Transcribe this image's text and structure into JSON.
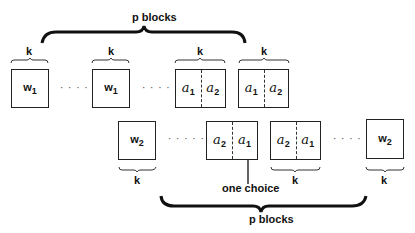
{
  "top": {
    "brace_label": "p  blocks",
    "k_labels": [
      "k",
      "k",
      "k",
      "k"
    ],
    "boxes": [
      {
        "type": "single",
        "var": "w",
        "sub": "1"
      },
      {
        "type": "single",
        "var": "w",
        "sub": "1"
      },
      {
        "type": "split",
        "left": {
          "var": "a",
          "sub": "1"
        },
        "right": {
          "var": "a",
          "sub": "2"
        }
      },
      {
        "type": "split",
        "left": {
          "var": "a",
          "sub": "1"
        },
        "right": {
          "var": "a",
          "sub": "2"
        }
      }
    ],
    "dots": [
      "· · · ·",
      "· · · ·"
    ]
  },
  "bottom": {
    "brace_label": "p  blocks",
    "k_labels": [
      "k",
      "k",
      "k"
    ],
    "boxes": [
      {
        "type": "single",
        "var": "w",
        "sub": "2"
      },
      {
        "type": "split",
        "left": {
          "var": "a",
          "sub": "2"
        },
        "right": {
          "var": "a",
          "sub": "1"
        }
      },
      {
        "type": "split",
        "left": {
          "var": "a",
          "sub": "2"
        },
        "right": {
          "var": "a",
          "sub": "1"
        }
      },
      {
        "type": "single",
        "var": "w",
        "sub": "2"
      }
    ],
    "dots": [
      "· · · · ·",
      "· · · ·"
    ],
    "annotation": "one choice"
  }
}
